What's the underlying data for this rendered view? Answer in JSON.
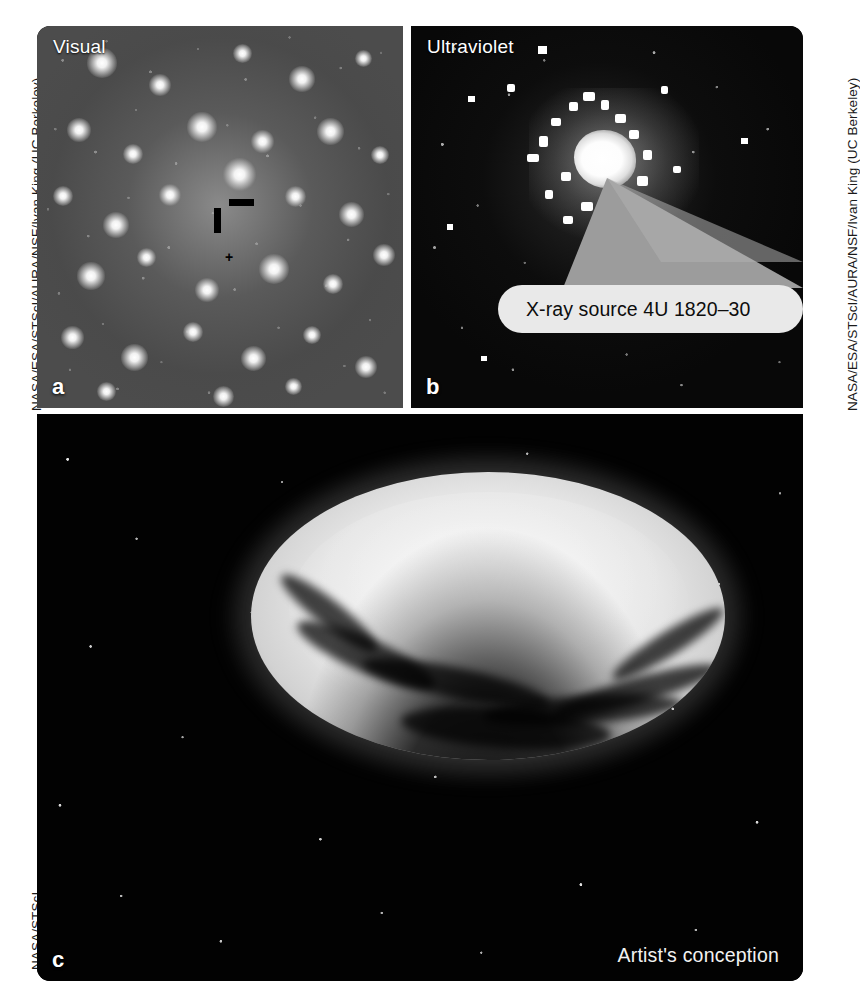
{
  "figure": {
    "background_color": "#ffffff"
  },
  "credits": {
    "hubble_observations": "NASA/ESA/STScI/AURA/NSF/Ivan King (UC Berkeley)",
    "artist_illustration": "NASA/STScI"
  },
  "panels": [
    {
      "letter": "a",
      "label": "Visual",
      "type": "telescope-image",
      "description": "Dense globular cluster star field in visible light",
      "markers": {
        "tick_vertical": "black-tick-vertical",
        "tick_horizontal": "black-tick-horizontal",
        "source_point": "+"
      }
    },
    {
      "letter": "b",
      "label": "Ultraviolet",
      "type": "telescope-image",
      "description": "Same cluster field in ultraviolet showing a single bright compact source",
      "callout": {
        "text": "X-ray source 4U 1820–30",
        "box_color": "#e9e9e9",
        "wedge_color": "#9a9a9a"
      }
    },
    {
      "letter": "c",
      "label": "",
      "type": "illustration",
      "corner_note": "Artist's conception",
      "description": "Accretion disk around a compact object fed by a teardrop-shaped donor star"
    }
  ],
  "colors": {
    "panel_background": "#000000",
    "label_text": "#ffffff",
    "credit_text": "#1a1a1a",
    "callout_fill": "#e9e9e9",
    "callout_text": "#0d0d0d",
    "disk_bright": "#f2f2f2",
    "star_white": "#ffffff"
  }
}
